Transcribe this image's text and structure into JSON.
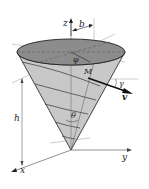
{
  "figure": {
    "type": "inverted-cone-spiral",
    "labels": {
      "z_axis": "z",
      "x_axis": "x",
      "y_axis": "y",
      "radius": "b",
      "height": "h",
      "azimuth": "φ",
      "point": "M",
      "path_angle": "γ",
      "velocity": "v",
      "half_angle": "θ"
    },
    "colors": {
      "cone_fill": "#c8c8c8",
      "top_fill": "#8c8c8c",
      "lines": "#333333",
      "guides": "#888888"
    }
  }
}
